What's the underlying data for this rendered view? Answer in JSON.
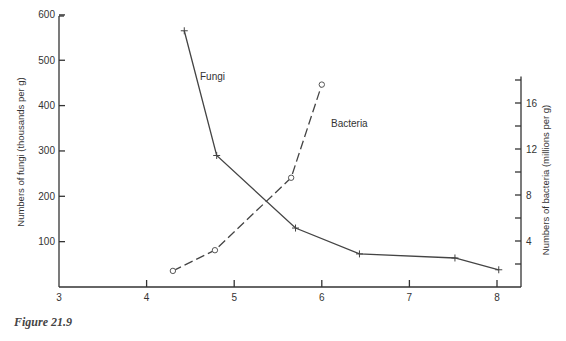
{
  "figure": {
    "caption": "Figure 21.9"
  },
  "chart_data": {
    "type": "line",
    "title": "",
    "xlabel": "pH",
    "ylabel": "Numbers of fungi (thousands per g)",
    "y2label": "Numbers of bacteria (millions per g)",
    "xlim": [
      3,
      8.2
    ],
    "ylim": [
      0,
      600
    ],
    "y2lim": [
      0,
      18
    ],
    "x_ticks": [
      3,
      4,
      5,
      6,
      7,
      8
    ],
    "y_ticks": [
      100,
      200,
      300,
      400,
      500,
      600
    ],
    "y2_ticks_labeled": [
      4,
      8,
      12,
      16
    ],
    "y2_ticks_minor": [
      2,
      6,
      10,
      14,
      18
    ],
    "grid": false,
    "legend": "inline labels",
    "series": [
      {
        "name": "Fungi",
        "axis": "left",
        "marker": "plus",
        "line_style": "solid",
        "x": [
          4.43,
          4.8,
          5.7,
          6.43,
          7.52,
          8.02
        ],
        "values": [
          565,
          290,
          130,
          73,
          64,
          38
        ]
      },
      {
        "name": "Bacteria",
        "axis": "right",
        "marker": "circle",
        "line_style": "dashed",
        "x": [
          4.3,
          4.78,
          5.65,
          6.0
        ],
        "values": [
          1.4,
          3.2,
          9.5,
          17.6
        ]
      }
    ]
  },
  "labels": {
    "fungi": "Fungi",
    "bacteria": "Bacteria"
  }
}
